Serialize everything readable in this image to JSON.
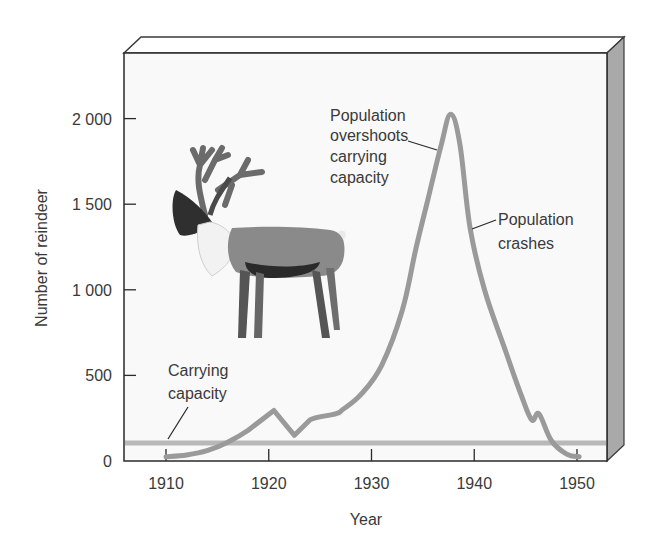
{
  "chart_data": {
    "type": "line",
    "title": "",
    "xlabel": "Year",
    "ylabel": "Number of reindeer",
    "xlim": [
      1906,
      1953
    ],
    "ylim": [
      0,
      2400
    ],
    "x_ticks": [
      1910,
      1920,
      1930,
      1940,
      1950
    ],
    "x_tick_labels": [
      "1910",
      "1920",
      "1930",
      "1940",
      "1950"
    ],
    "y_ticks": [
      0,
      500,
      1000,
      1500,
      2000
    ],
    "y_tick_labels": [
      "0",
      "500",
      "1 000",
      "1 500",
      "2 000"
    ],
    "grid": false,
    "legend": null,
    "series": [
      {
        "name": "Reindeer population",
        "color": "#9a9a9a",
        "x": [
          1910,
          1912,
          1914,
          1916,
          1918,
          1920.5,
          1922.5,
          1924,
          1926.5,
          1927.2,
          1929,
          1931,
          1933,
          1934.3,
          1935.5,
          1936.8,
          1937.7,
          1938.6,
          1939.6,
          1941,
          1943,
          1944.6,
          1945.6,
          1946.3,
          1947.5,
          1949,
          1950.2
        ],
        "values": [
          25,
          35,
          60,
          110,
          180,
          295,
          150,
          240,
          275,
          300,
          390,
          560,
          880,
          1235,
          1530,
          1850,
          2025,
          1850,
          1360,
          1000,
          650,
          380,
          240,
          275,
          120,
          40,
          25
        ]
      },
      {
        "name": "Carrying capacity",
        "color": "#b8b8b8",
        "x": [
          1906,
          1953
        ],
        "values": [
          105,
          105
        ]
      }
    ],
    "annotations": [
      {
        "text": "Population overshoots carrying capacity",
        "lines": [
          "Population",
          "overshoots",
          "carrying",
          "capacity"
        ],
        "points_to": {
          "x": 1936.2,
          "y": 1750
        }
      },
      {
        "text": "Population crashes",
        "lines": [
          "Population",
          "crashes"
        ],
        "points_to": {
          "x": 1939.7,
          "y": 1360
        }
      },
      {
        "text": "Carrying capacity",
        "lines": [
          "Carrying",
          "capacity"
        ],
        "points_to": {
          "x": 1910,
          "y": 105
        }
      }
    ],
    "illustration": "reindeer"
  }
}
